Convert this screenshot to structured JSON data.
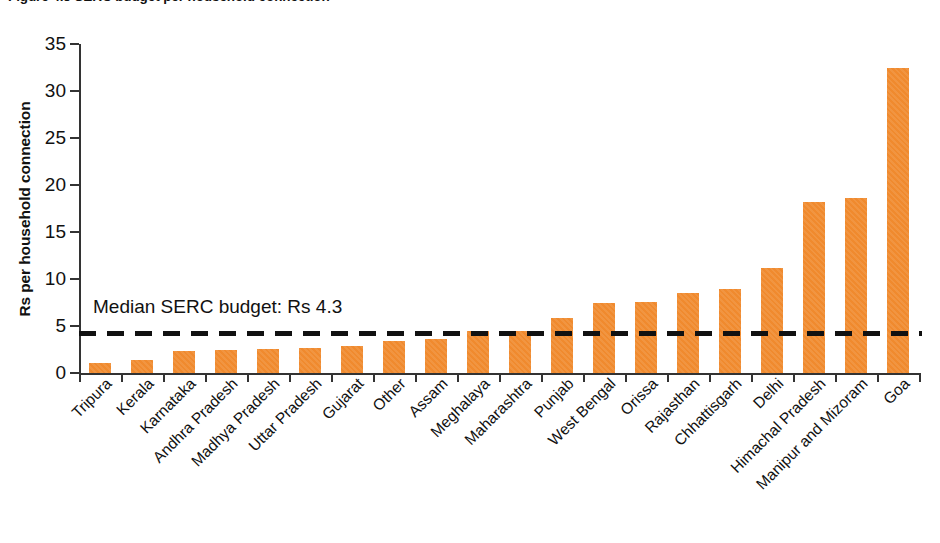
{
  "figure": {
    "title": "Figure 4.5  SERC budget per household connection",
    "title_clipped": true
  },
  "chart_data": {
    "type": "bar",
    "title": "Figure 4.5  SERC budget per household connection",
    "xlabel": "",
    "ylabel": "Rs per household connection",
    "ylim": [
      0,
      35
    ],
    "yticks": [
      0,
      5,
      10,
      15,
      20,
      25,
      30,
      35
    ],
    "ytick_labels": [
      "0",
      "5",
      "10",
      "15",
      "20",
      "25",
      "30",
      "35"
    ],
    "grid": false,
    "legend": "none",
    "bar_color": "#f08a2e",
    "categories": [
      "Tripura",
      "Kerala",
      "Karnataka",
      "Andhra Pradesh",
      "Madhya Pradesh",
      "Uttar Pradesh",
      "Gujarat",
      "Other",
      "Assam",
      "Meghalaya",
      "Maharashtra",
      "Punjab",
      "West Bengal",
      "Orissa",
      "Rajasthan",
      "Chhattisgarh",
      "Delhi",
      "Himachal Pradesh",
      "Manipur and Mizoram",
      "Goa"
    ],
    "values": [
      1.1,
      1.4,
      2.3,
      2.4,
      2.6,
      2.7,
      2.9,
      3.4,
      3.6,
      4.5,
      4.5,
      5.9,
      7.5,
      7.6,
      8.5,
      8.9,
      11.2,
      18.2,
      18.6,
      32.4
    ],
    "annotations": [
      {
        "name": "median-serc-budget",
        "label": "Median SERC budget: Rs 4.3",
        "type": "hline",
        "value": 4.3,
        "style": "dashed",
        "color": "#111111"
      }
    ]
  }
}
